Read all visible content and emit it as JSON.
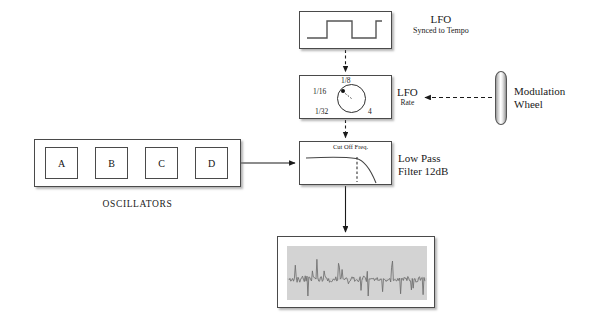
{
  "diagram": {
    "background_color": "#ffffff",
    "line_color": "#1a1a1a"
  },
  "lfo_source": {
    "panel_name": "LFO waveform display",
    "waveform": "square",
    "label_main": "LFO",
    "label_sub": "Synced to Tempo"
  },
  "lfo_rate": {
    "panel_name": "LFO rate knob",
    "label_main": "LFO",
    "label_sub": "Rate",
    "knob_positions": {
      "top": "1/8",
      "upper_left": "1/16",
      "lower_left": "1/32",
      "lower_right": "4"
    },
    "knob_pointer": "upper-left"
  },
  "filter": {
    "panel_name": "Low pass filter response",
    "curve_label": "Cut Off Freq.",
    "label_line1": "Low Pass",
    "label_line2": "Filter 12dB",
    "response": "flat then steep rolloff",
    "cutoff_marker": "dashed vertical line"
  },
  "oscillators": {
    "caption": "OSCILLATORS",
    "boxes": [
      {
        "label": "A"
      },
      {
        "label": "B"
      },
      {
        "label": "C"
      },
      {
        "label": "D"
      }
    ]
  },
  "modulation_wheel": {
    "label_line1": "Modulation",
    "label_line2": "Wheel",
    "shape": "vertical-wheel"
  },
  "output": {
    "panel_name": "Output waveform scope",
    "screen_color": "#d3d3d3",
    "content": "audio waveform"
  },
  "connections": [
    {
      "from": "lfo_source",
      "to": "lfo_rate",
      "style": "dashed",
      "direction": "down"
    },
    {
      "from": "lfo_rate",
      "to": "filter",
      "style": "dashed",
      "direction": "down"
    },
    {
      "from": "modulation_wheel",
      "to": "lfo_rate",
      "style": "dashed",
      "direction": "left"
    },
    {
      "from": "oscillators",
      "to": "filter",
      "style": "solid",
      "direction": "right"
    },
    {
      "from": "filter",
      "to": "output",
      "style": "solid",
      "direction": "down"
    },
    {
      "from": "osc_a",
      "to": "osc_b",
      "style": "solid",
      "direction": "right"
    },
    {
      "from": "osc_b",
      "to": "osc_c",
      "style": "solid",
      "direction": "right"
    },
    {
      "from": "osc_c",
      "to": "osc_d",
      "style": "solid",
      "direction": "right"
    }
  ]
}
